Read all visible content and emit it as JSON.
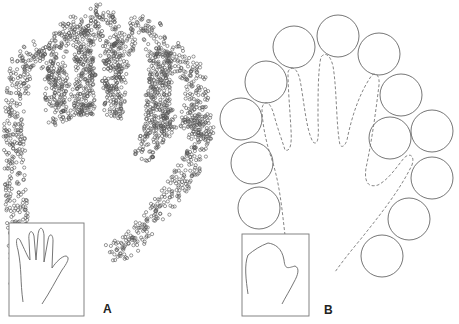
{
  "figure": {
    "panels": [
      {
        "id": "A",
        "label": "A",
        "label_pos": [
          103,
          302
        ],
        "inset_box": [
          9,
          223,
          75,
          93
        ],
        "dot_bands": [
          {
            "path": [
              [
                22,
                290
              ],
              [
                16,
                200
              ],
              [
                14,
                120
              ],
              [
                22,
                60
              ],
              [
                40,
                50
              ],
              [
                60,
                85
              ],
              [
                75,
                120
              ]
            ],
            "width": 22
          },
          {
            "path": [
              [
                55,
                125
              ],
              [
                55,
                70
              ],
              [
                62,
                30
              ],
              [
                78,
                25
              ],
              [
                85,
                60
              ],
              [
                88,
                115
              ]
            ],
            "width": 20
          },
          {
            "path": [
              [
                85,
                115
              ],
              [
                84,
                50
              ],
              [
                92,
                15
              ],
              [
                105,
                12
              ],
              [
                110,
                50
              ],
              [
                114,
                115
              ]
            ],
            "width": 20
          },
          {
            "path": [
              [
                112,
                118
              ],
              [
                118,
                60
              ],
              [
                130,
                28
              ],
              [
                150,
                25
              ],
              [
                160,
                60
              ],
              [
                158,
                130
              ]
            ],
            "width": 22
          },
          {
            "path": [
              [
                155,
                140
              ],
              [
                158,
                90
              ],
              [
                170,
                50
              ],
              [
                195,
                75
              ],
              [
                200,
                125
              ],
              [
                200,
                140
              ]
            ],
            "width": 24
          },
          {
            "path": [
              [
                140,
                160
              ],
              [
                150,
                140
              ],
              [
                180,
                115
              ],
              [
                205,
                125
              ],
              [
                200,
                150
              ],
              [
                185,
                175
              ],
              [
                160,
                210
              ],
              [
                130,
                245
              ],
              [
                110,
                255
              ]
            ],
            "width": 22
          }
        ],
        "dot_color": "#555555",
        "inset_hand_path": "M23,302 C20,280 22,270 18,250 C15,240 17,236 20,240 C24,248 28,258 30,260 L29,240 C28,232 32,228 34,236 L36,260 L38,235 C39,226 43,226 44,235 L44,262 L48,240 C49,233 53,233 53,241 L52,268 C56,262 62,256 66,256 C70,257 68,262 62,270 C56,280 50,292 42,304"
      },
      {
        "id": "B",
        "label": "B",
        "label_pos": [
          324,
          303
        ],
        "inset_box": [
          242,
          234,
          67,
          82
        ],
        "circles": [
          [
            338,
            36
          ],
          [
            294,
            47
          ],
          [
            379,
            54
          ],
          [
            266,
            82
          ],
          [
            401,
            95
          ],
          [
            241,
            119
          ],
          [
            390,
            138
          ],
          [
            432,
            131
          ],
          [
            252,
            163
          ],
          [
            432,
            178
          ],
          [
            259,
            208
          ],
          [
            409,
            219
          ],
          [
            382,
            256
          ]
        ],
        "circle_radius": 21,
        "dashed_outline_path": "M285,235 C282,210 280,185 272,160 C265,140 262,120 262,108 C264,100 270,100 274,115 C278,130 282,140 285,150 C290,152 292,145 291,130 C290,110 288,90 288,72 C290,66 297,66 300,80 C304,100 306,130 313,142 C318,146 319,138 318,120 C318,95 318,70 321,57 C325,52 330,54 333,66 C337,90 336,125 340,145 C342,148 345,146 347,140 C352,115 360,92 372,75 C376,72 380,76 379,85 C376,110 372,140 366,168 C364,182 368,188 378,185 C388,180 396,168 404,158 C410,152 415,156 412,165 C400,190 380,215 360,240 C350,252 342,262 335,272",
        "inset_path": "M248,294 C246,280 244,265 248,255 C254,250 260,246 268,243 C275,244 282,248 284,260 C285,270 288,268 295,266 C300,268 298,275 294,282 C290,290 285,298 282,304",
        "line_color": "#666666"
      }
    ]
  }
}
